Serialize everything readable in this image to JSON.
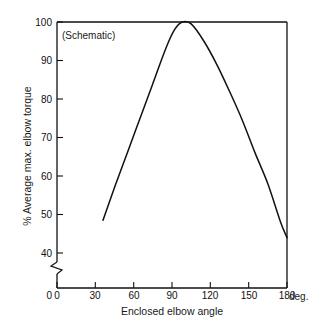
{
  "figure": {
    "annotation": "(Schematic)",
    "x_axis_title": "Enclosed elbow angle",
    "y_axis_title": "% Average max. elbow torque",
    "x_unit_label": "deg.",
    "line_color": "#111111",
    "axis_color": "#111111",
    "background": "#ffffff"
  },
  "chart_data": {
    "type": "line",
    "title": "",
    "subtitle": "(Schematic)",
    "xlabel": "Enclosed elbow angle",
    "ylabel": "% Average max. elbow torque",
    "x_unit": "deg.",
    "xlim": [
      0,
      180
    ],
    "ylim": [
      35,
      100
    ],
    "y_axis_break": true,
    "y_axis_break_note": "axis broken between 0 and ~37",
    "grid": false,
    "legend": null,
    "xticks": [
      0,
      30,
      60,
      90,
      120,
      150,
      180
    ],
    "xtick_labels": [
      "0",
      "30",
      "60",
      "90",
      "120",
      "150",
      "180"
    ],
    "yticks": [
      40,
      50,
      60,
      70,
      80,
      90,
      100
    ],
    "ytick_labels": [
      "40",
      "50",
      "60",
      "70",
      "80",
      "90",
      "100"
    ],
    "y_origin_label": "0",
    "series": [
      {
        "name": "Average max. elbow torque",
        "x": [
          36,
          45,
          55,
          65,
          75,
          85,
          92,
          98,
          105,
          115,
          125,
          135,
          145,
          155,
          165,
          175,
          180
        ],
        "values": [
          48.5,
          57,
          66,
          75,
          84,
          93,
          98,
          100,
          99.5,
          95,
          89,
          82,
          74.5,
          66,
          58,
          48,
          44
        ]
      }
    ],
    "peak": {
      "x": 98,
      "y": 100
    },
    "start_point": {
      "x": 36,
      "y": 48.5
    },
    "end_point": {
      "x": 180,
      "y": 44
    }
  }
}
